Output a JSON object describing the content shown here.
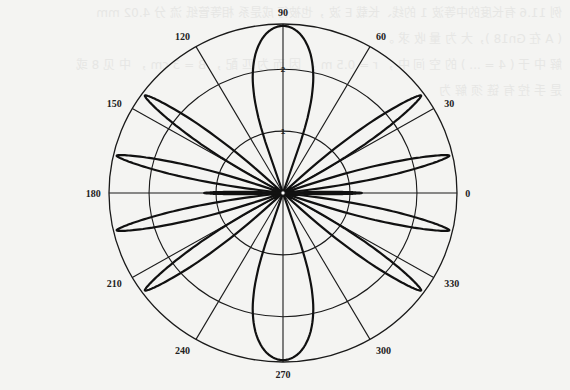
{
  "chart_data": {
    "type": "polar",
    "title": "",
    "center_px": [
      283,
      193
    ],
    "radius_px": {
      "x": 174,
      "y": 169
    },
    "r_max": 2.65,
    "radial_ticks": [
      {
        "value": 1,
        "label": "1"
      },
      {
        "value": 2,
        "label": "2"
      }
    ],
    "angle_ticks": [
      {
        "deg": 0,
        "label": "0"
      },
      {
        "deg": 30,
        "label": "30"
      },
      {
        "deg": 60,
        "label": "60"
      },
      {
        "deg": 90,
        "label": "90"
      },
      {
        "deg": 120,
        "label": "120"
      },
      {
        "deg": 150,
        "label": "150"
      },
      {
        "deg": 180,
        "label": "180"
      },
      {
        "deg": 210,
        "label": "210"
      },
      {
        "deg": 240,
        "label": "240"
      },
      {
        "deg": 270,
        "label": "270"
      },
      {
        "deg": 300,
        "label": "300"
      },
      {
        "deg": 330,
        "label": "330"
      }
    ],
    "grid": true,
    "series": [
      {
        "name": "radiation pattern",
        "lobes": [
          {
            "center_deg": 90,
            "peak_r": 2.62,
            "half_width_deg": 19,
            "shape": "broad"
          },
          {
            "center_deg": 270,
            "peak_r": 2.62,
            "half_width_deg": 19,
            "shape": "broad"
          },
          {
            "center_deg": 36,
            "peak_r": 2.6,
            "half_width_deg": 7,
            "shape": "narrow"
          },
          {
            "center_deg": 144,
            "peak_r": 2.6,
            "half_width_deg": 7,
            "shape": "narrow"
          },
          {
            "center_deg": 216,
            "peak_r": 2.6,
            "half_width_deg": 7,
            "shape": "narrow"
          },
          {
            "center_deg": 324,
            "peak_r": 2.6,
            "half_width_deg": 7,
            "shape": "narrow"
          },
          {
            "center_deg": 13,
            "peak_r": 2.6,
            "half_width_deg": 6,
            "shape": "narrow"
          },
          {
            "center_deg": 167,
            "peak_r": 2.6,
            "half_width_deg": 6,
            "shape": "narrow"
          },
          {
            "center_deg": 193,
            "peak_r": 2.6,
            "half_width_deg": 6,
            "shape": "narrow"
          },
          {
            "center_deg": 347,
            "peak_r": 2.6,
            "half_width_deg": 6,
            "shape": "narrow"
          },
          {
            "center_deg": 0,
            "peak_r": 1.2,
            "half_width_deg": 2.5,
            "shape": "narrow"
          },
          {
            "center_deg": 180,
            "peak_r": 1.2,
            "half_width_deg": 2.5,
            "shape": "narrow"
          }
        ]
      }
    ],
    "legend": null
  },
  "background_text": [
    "例 11.6  有长度的中等波 1 的线、长载 E 波 ，也被行 成是系 相等管纸 流 分 4.02 mm",
    "( A 在 Gn18 )，大 为 量 收 求 。",
    "解  中 于 ( 4 = ... ) 的 空 间 中 ， r = 0.5 m ， 因 而 为 匹 配 ， B = 3 cm ， 中 见 8 或",
    "是 手 控 有 链 须 解 为"
  ]
}
